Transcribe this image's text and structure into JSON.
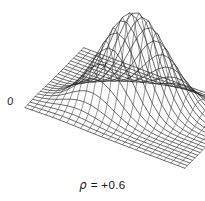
{
  "figure": {
    "kind": "3d-wireframe-surface-plot",
    "background_color": "#ffffff",
    "line_color": "#111111",
    "origin_label": "0",
    "caption_symbol": "ρ",
    "caption_relation": "=",
    "caption_value": "+0.6",
    "caption_full": "ρ = +0.6"
  },
  "chart_data": {
    "type": "surface",
    "title": "ρ = +0.6",
    "xlabel": "",
    "ylabel": "",
    "zlabel": "",
    "grid": true,
    "legend_position": "none",
    "annotations": [
      {
        "text": "0",
        "role": "origin-tick",
        "x_px": 14,
        "y_px": 102
      },
      {
        "text": "ρ = +0.6",
        "role": "caption",
        "x_px": 102,
        "y_px": 186
      }
    ],
    "correlation": 0.6,
    "surface_params": {
      "sigma_x": 1.0,
      "sigma_y": 1.0,
      "rho": 0.6,
      "peak_amplitude": 1.0
    },
    "x_range": [
      -3.0,
      3.0
    ],
    "y_range": [
      -3.0,
      3.0
    ],
    "z_range": [
      0.0,
      1.0
    ],
    "mesh_resolution": {
      "nx": 24,
      "ny": 24
    },
    "projection": {
      "origin_px": [
        25,
        108
      ],
      "x_axis_px": [
        6.95,
        2.62
      ],
      "y_axis_px": [
        2.55,
        2.62
      ],
      "z_axis_px": [
        0,
        -96
      ]
    },
    "vertical_exaggeration": 1.0
  }
}
